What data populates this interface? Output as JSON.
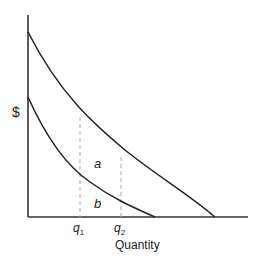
{
  "diagram": {
    "type": "economics-two-curves",
    "axes": {
      "y_label": "$",
      "x_label": "Quantity"
    },
    "x_ticks": [
      {
        "base": "q",
        "sub": "1"
      },
      {
        "base": "q",
        "sub": "2"
      }
    ],
    "regions": [
      {
        "id": "a",
        "label": "a"
      },
      {
        "id": "b",
        "label": "b"
      }
    ],
    "curves": [
      {
        "name": "upper-curve",
        "color": "#222222"
      },
      {
        "name": "lower-curve",
        "color": "#222222"
      }
    ],
    "colors": {
      "axis": "#333333",
      "curve": "#222222",
      "guide": "#aaaaaa"
    }
  }
}
